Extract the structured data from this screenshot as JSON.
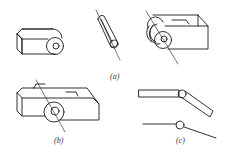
{
  "figure": {
    "labels": {
      "a": "(a)",
      "b": "(b)",
      "c": "(c)"
    },
    "colors": {
      "stroke": "#1a1a1a",
      "background": "#ffffff",
      "label": "#333333"
    }
  }
}
